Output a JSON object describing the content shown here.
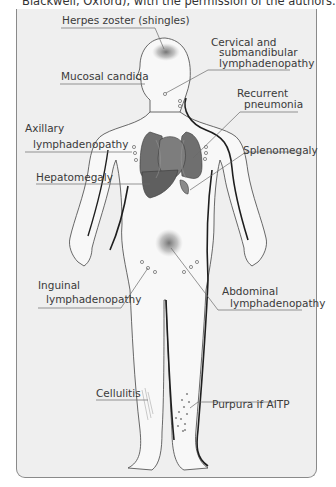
{
  "caption": "Blackwell, Oxford), with the permission of the authors.",
  "colors": {
    "panel": "#efefef",
    "frame": "#8a8a8a",
    "organ": "#6b6b6b",
    "skin": "#f7f7f7",
    "outline": "#222222",
    "leader": "#666666",
    "shade": "#7a7a7a"
  },
  "labels": {
    "herpes": "Herpes zoster (shingles)",
    "cervical_1": "Cervical and",
    "cervical_2": "submandibular",
    "cervical_3": "lymphadenopathy",
    "mucosal": "Mucosal candida",
    "pneumonia_1": "Recurrent",
    "pneumonia_2": "pneumonia",
    "axillary_1": "Axillary",
    "axillary_2": "lymphadenopathy",
    "splenomegaly": "Splenomegaly",
    "hepatomegaly": "Hepatomegaly",
    "inguinal_1": "Inguinal",
    "inguinal_2": "lymphadenopathy",
    "abdominal_1": "Abdominal",
    "abdominal_2": "lymphadenopathy",
    "cellulitis": "Cellulitis",
    "purpura": "Purpura if AITP"
  }
}
